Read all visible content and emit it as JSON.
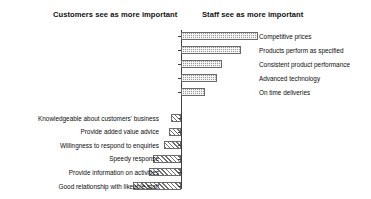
{
  "headings": {
    "customers": "Customers see as more important",
    "staff": "Staff see as more important"
  },
  "chart_data": {
    "type": "bar",
    "title": "",
    "subtitle": "",
    "orientation": "horizontal",
    "grid": false,
    "legend_position": "none",
    "xlabel": "",
    "ylabel": "",
    "axis": {
      "center_value": 0,
      "note": "Diverging horizontal bar chart about a central vertical axis; bars to the right indicate items staff rate as more important, bars to the left indicate items customers rate as more important. No numeric scale is printed on the axis."
    },
    "series": [
      {
        "name": "Staff see as more important",
        "direction": "right",
        "pattern": "stipple",
        "categories": [
          "Competitive prices",
          "Products perform as specified",
          "Consistent product performance",
          "Advanced technology",
          "On time deliveries"
        ],
        "values": [
          77,
          60,
          41,
          36,
          24
        ]
      },
      {
        "name": "Customers see as more important",
        "direction": "left",
        "pattern": "diagonal-hatch",
        "categories": [
          "Knowledgeable about customers' business",
          "Provide added value advice",
          "Willingness to respond to enquiries",
          "Speedy response",
          "Provide information on activities",
          "Good relationship with likeable staff"
        ],
        "values": [
          10,
          12,
          17,
          28,
          32,
          48
        ]
      }
    ]
  },
  "colors": {
    "bar_fill": "#9a9a9a",
    "bar_outline": "#6a6a6a",
    "axis": "#3f3f3f",
    "text": "#111111",
    "background": "#ffffff"
  }
}
